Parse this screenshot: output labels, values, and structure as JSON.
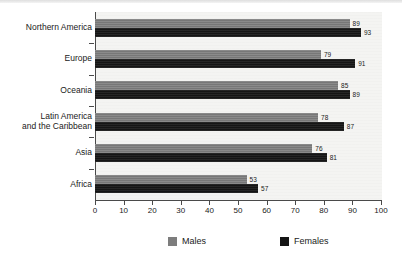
{
  "chart_data": {
    "type": "bar",
    "orientation": "horizontal",
    "title": "",
    "subtitle": "",
    "xlabel": "",
    "ylabel": "",
    "xlim": [
      0,
      100
    ],
    "xticks": [
      0,
      10,
      20,
      30,
      40,
      50,
      60,
      70,
      80,
      90,
      100
    ],
    "xtick_labels": [
      "0",
      "10",
      "20",
      "30",
      "40",
      "50",
      "60",
      "70",
      "80",
      "90",
      "100"
    ],
    "grid": false,
    "legend_position": "bottom",
    "categories": [
      "Northern America",
      "Europe",
      "Oceania",
      "Latin America and the Caribbean",
      "Asia",
      "Africa"
    ],
    "category_lines": [
      [
        "Northern America"
      ],
      [
        "Europe"
      ],
      [
        "Oceania"
      ],
      [
        "Latin America",
        "and the Caribbean"
      ],
      [
        "Asia"
      ],
      [
        "Africa"
      ]
    ],
    "series": [
      {
        "name": "Males",
        "color": "#7d7d7d",
        "values": [
          89,
          79,
          85,
          78,
          76,
          53
        ]
      },
      {
        "name": "Females",
        "color": "#151515",
        "values": [
          93,
          91,
          89,
          87,
          81,
          57
        ]
      }
    ]
  },
  "legend": {
    "items": [
      {
        "label": "Males",
        "color": "#7d7d7d"
      },
      {
        "label": "Females",
        "color": "#151515"
      }
    ]
  }
}
